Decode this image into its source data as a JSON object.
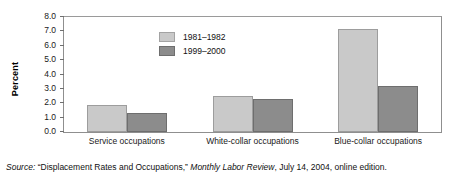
{
  "chart_data": {
    "type": "bar",
    "title": "",
    "xlabel": "",
    "ylabel": "Percent",
    "ylim": [
      0.0,
      8.0
    ],
    "ytick_step": 1.0,
    "ytick_labels": [
      "0.0",
      "1.0",
      "2.0",
      "3.0",
      "4.0",
      "5.0",
      "6.0",
      "7.0",
      "8.0"
    ],
    "grid": false,
    "legend_position": "top-left inside plot",
    "categories": [
      "Service occupations",
      "White-collar occupations",
      "Blue-collar occupations"
    ],
    "series": [
      {
        "name": "1981–1982",
        "color": "#c9c9c9",
        "values": [
          1.9,
          2.5,
          7.2
        ]
      },
      {
        "name": "1999–2000",
        "color": "#8c8c8c",
        "values": [
          1.3,
          2.3,
          3.2
        ]
      }
    ]
  },
  "source": {
    "label": "Source:",
    "quoted_title": "“Displacement Rates and Occupations,”",
    "publication": "Monthly Labor Review",
    "rest": ", July 14, 2004, online edition."
  }
}
